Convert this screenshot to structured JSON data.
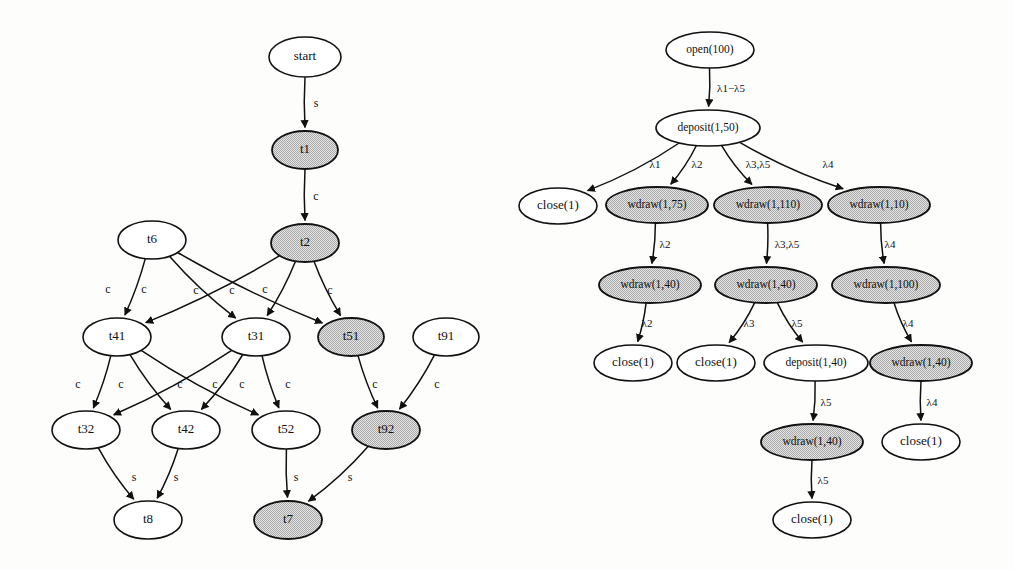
{
  "figure": {
    "background_color": "#fdfdfc",
    "node_fill_plain": "#ffffff",
    "node_fill_shaded": "#c8c8c8",
    "stroke_color": "#111111"
  },
  "left_graph": {
    "name": "transaction-dependency-graph",
    "nodes": [
      {
        "id": "start",
        "label": "start",
        "x": 305,
        "y": 57,
        "rx": 36,
        "ry": 20,
        "shaded": false
      },
      {
        "id": "t1",
        "label": "t1",
        "x": 305,
        "y": 150,
        "rx": 33,
        "ry": 19,
        "shaded": true
      },
      {
        "id": "t2",
        "label": "t2",
        "x": 305,
        "y": 243,
        "rx": 34,
        "ry": 19,
        "shaded": true
      },
      {
        "id": "t6",
        "label": "t6",
        "x": 152,
        "y": 240,
        "rx": 34,
        "ry": 19,
        "shaded": false
      },
      {
        "id": "t41",
        "label": "t41",
        "x": 117,
        "y": 337,
        "rx": 34,
        "ry": 19,
        "shaded": false
      },
      {
        "id": "t31",
        "label": "t31",
        "x": 256,
        "y": 337,
        "rx": 34,
        "ry": 19,
        "shaded": false
      },
      {
        "id": "t51",
        "label": "t51",
        "x": 351,
        "y": 337,
        "rx": 33,
        "ry": 19,
        "shaded": true
      },
      {
        "id": "t91",
        "label": "t91",
        "x": 446,
        "y": 337,
        "rx": 33,
        "ry": 19,
        "shaded": false
      },
      {
        "id": "t32",
        "label": "t32",
        "x": 86,
        "y": 430,
        "rx": 34,
        "ry": 19,
        "shaded": false
      },
      {
        "id": "t42",
        "label": "t42",
        "x": 186,
        "y": 430,
        "rx": 34,
        "ry": 19,
        "shaded": false
      },
      {
        "id": "t52",
        "label": "t52",
        "x": 286,
        "y": 430,
        "rx": 34,
        "ry": 19,
        "shaded": false
      },
      {
        "id": "t92",
        "label": "t92",
        "x": 386,
        "y": 430,
        "rx": 34,
        "ry": 19,
        "shaded": true
      },
      {
        "id": "t8",
        "label": "t8",
        "x": 148,
        "y": 520,
        "rx": 34,
        "ry": 19,
        "shaded": false
      },
      {
        "id": "t7",
        "label": "t7",
        "x": 288,
        "y": 520,
        "rx": 34,
        "ry": 19,
        "shaded": true
      }
    ],
    "edges": [
      {
        "from": "start",
        "to": "t1",
        "label": "s",
        "lx": 316,
        "ly": 104
      },
      {
        "from": "t1",
        "to": "t2",
        "label": "c",
        "lx": 316,
        "ly": 197
      },
      {
        "from": "t6",
        "to": "t41",
        "label": "c",
        "lx": 108,
        "ly": 290
      },
      {
        "from": "t6",
        "to": "t31",
        "label": "c",
        "lx": 144,
        "ly": 290
      },
      {
        "from": "t6",
        "to": "t51",
        "label": "c",
        "lx": 196,
        "ly": 291
      },
      {
        "from": "t2",
        "to": "t41",
        "label": "c",
        "lx": 232,
        "ly": 291
      },
      {
        "from": "t2",
        "to": "t31",
        "label": "c",
        "lx": 265,
        "ly": 290
      },
      {
        "from": "t2",
        "to": "t51",
        "label": "c",
        "lx": 330,
        "ly": 291
      },
      {
        "from": "t41",
        "to": "t32",
        "label": "c",
        "lx": 78,
        "ly": 385
      },
      {
        "from": "t41",
        "to": "t42",
        "label": "c",
        "lx": 121,
        "ly": 385
      },
      {
        "from": "t41",
        "to": "t52",
        "label": "c",
        "lx": 180,
        "ly": 385
      },
      {
        "from": "t31",
        "to": "t32",
        "label": "c",
        "lx": 215,
        "ly": 385
      },
      {
        "from": "t31",
        "to": "t42",
        "label": "c",
        "lx": 242,
        "ly": 385
      },
      {
        "from": "t31",
        "to": "t52",
        "label": "c",
        "lx": 288,
        "ly": 385
      },
      {
        "from": "t51",
        "to": "t92",
        "label": "c",
        "lx": 375,
        "ly": 385
      },
      {
        "from": "t91",
        "to": "t92",
        "label": "c",
        "lx": 437,
        "ly": 385
      },
      {
        "from": "t32",
        "to": "t8",
        "label": "s",
        "lx": 134,
        "ly": 478
      },
      {
        "from": "t42",
        "to": "t8",
        "label": "s",
        "lx": 176,
        "ly": 478
      },
      {
        "from": "t52",
        "to": "t7",
        "label": "s",
        "lx": 296,
        "ly": 478
      },
      {
        "from": "t92",
        "to": "t7",
        "label": "s",
        "lx": 350,
        "ly": 478
      }
    ]
  },
  "right_graph": {
    "name": "bank-account-history-tree",
    "nodes": [
      {
        "id": "open100",
        "label": "open(100)",
        "x": 710,
        "y": 50,
        "rx": 44,
        "ry": 18,
        "shaded": false
      },
      {
        "id": "dep150",
        "label": "deposit(1,50)",
        "x": 708,
        "y": 128,
        "rx": 52,
        "ry": 18,
        "shaded": false
      },
      {
        "id": "close_a",
        "label": "close(1)",
        "x": 558,
        "y": 206,
        "rx": 39,
        "ry": 18,
        "shaded": false
      },
      {
        "id": "wd175",
        "label": "wdraw(1,75)",
        "x": 657,
        "y": 205,
        "rx": 51,
        "ry": 18,
        "shaded": true
      },
      {
        "id": "wd1110",
        "label": "wdraw(1,110)",
        "x": 768,
        "y": 205,
        "rx": 54,
        "ry": 18,
        "shaded": true
      },
      {
        "id": "wd110",
        "label": "wdraw(1,10)",
        "x": 879,
        "y": 205,
        "rx": 51,
        "ry": 18,
        "shaded": true
      },
      {
        "id": "wd140_a",
        "label": "wdraw(1,40)",
        "x": 650,
        "y": 285,
        "rx": 51,
        "ry": 18,
        "shaded": true
      },
      {
        "id": "wd140_b",
        "label": "wdraw(1,40)",
        "x": 766,
        "y": 285,
        "rx": 51,
        "ry": 18,
        "shaded": true
      },
      {
        "id": "wd1100",
        "label": "wdraw(1,100)",
        "x": 886,
        "y": 285,
        "rx": 54,
        "ry": 18,
        "shaded": true
      },
      {
        "id": "close_b",
        "label": "close(1)",
        "x": 633,
        "y": 363,
        "rx": 39,
        "ry": 18,
        "shaded": false
      },
      {
        "id": "close_c",
        "label": "close(1)",
        "x": 716,
        "y": 363,
        "rx": 39,
        "ry": 18,
        "shaded": false
      },
      {
        "id": "dep140",
        "label": "deposit(1,40)",
        "x": 816,
        "y": 363,
        "rx": 52,
        "ry": 18,
        "shaded": false
      },
      {
        "id": "wd140_c",
        "label": "wdraw(1,40)",
        "x": 921,
        "y": 363,
        "rx": 51,
        "ry": 18,
        "shaded": true
      },
      {
        "id": "wd140_d",
        "label": "wdraw(1,40)",
        "x": 812,
        "y": 442,
        "rx": 51,
        "ry": 18,
        "shaded": true
      },
      {
        "id": "close_d",
        "label": "close(1)",
        "x": 921,
        "y": 442,
        "rx": 39,
        "ry": 18,
        "shaded": false
      },
      {
        "id": "close_e",
        "label": "close(1)",
        "x": 812,
        "y": 520,
        "rx": 39,
        "ry": 18,
        "shaded": false
      }
    ],
    "edges": [
      {
        "from": "open100",
        "to": "dep150",
        "label": "λ1−λ5",
        "lx": 731,
        "ly": 89
      },
      {
        "from": "dep150",
        "to": "close_a",
        "label": "λ1",
        "lx": 655,
        "ly": 165
      },
      {
        "from": "dep150",
        "to": "wd175",
        "label": "λ2",
        "lx": 697,
        "ly": 165
      },
      {
        "from": "dep150",
        "to": "wd1110",
        "label": "λ3,λ5",
        "lx": 758,
        "ly": 165
      },
      {
        "from": "dep150",
        "to": "wd110",
        "label": "λ4",
        "lx": 828,
        "ly": 165
      },
      {
        "from": "wd175",
        "to": "wd140_a",
        "label": "λ2",
        "lx": 665,
        "ly": 245
      },
      {
        "from": "wd1110",
        "to": "wd140_b",
        "label": "λ3,λ5",
        "lx": 787,
        "ly": 245
      },
      {
        "from": "wd110",
        "to": "wd1100",
        "label": "λ4",
        "lx": 890,
        "ly": 245
      },
      {
        "from": "wd140_a",
        "to": "close_b",
        "label": "λ2",
        "lx": 647,
        "ly": 324
      },
      {
        "from": "wd140_b",
        "to": "close_c",
        "label": "λ3",
        "lx": 749,
        "ly": 324
      },
      {
        "from": "wd140_b",
        "to": "dep140",
        "label": "λ5",
        "lx": 797,
        "ly": 324
      },
      {
        "from": "wd1100",
        "to": "wd140_c",
        "label": "λ4",
        "lx": 908,
        "ly": 324
      },
      {
        "from": "dep140",
        "to": "wd140_d",
        "label": "λ5",
        "lx": 826,
        "ly": 403
      },
      {
        "from": "wd140_c",
        "to": "close_d",
        "label": "λ4",
        "lx": 932,
        "ly": 403
      },
      {
        "from": "wd140_d",
        "to": "close_e",
        "label": "λ5",
        "lx": 823,
        "ly": 481
      }
    ]
  }
}
